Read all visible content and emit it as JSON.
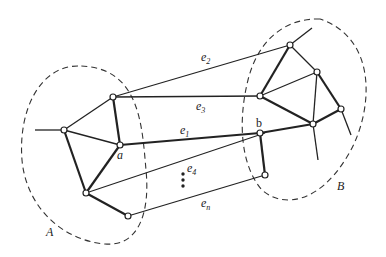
{
  "diagram": {
    "regions": [
      {
        "id": "A",
        "label": "A"
      },
      {
        "id": "B",
        "label": "B"
      }
    ],
    "nodes": {
      "a": {
        "label": "a"
      },
      "b": {
        "label": "b"
      }
    },
    "cut_edges": [
      {
        "id": "e1",
        "label": "e",
        "sub": "1",
        "from": "a",
        "to": "b"
      },
      {
        "id": "e2",
        "label": "e",
        "sub": "2",
        "from": "B",
        "to": "A"
      },
      {
        "id": "e3",
        "label": "e",
        "sub": "3",
        "from": "B",
        "to": "A"
      },
      {
        "id": "e4",
        "label": "e",
        "sub": "4",
        "from": "A",
        "to": "B"
      },
      {
        "id": "en",
        "label": "e",
        "sub": "n",
        "from": "B",
        "to": "A"
      }
    ],
    "ellipsis": "⋮",
    "colors": {
      "ink": "#222222",
      "background": "#ffffff"
    }
  }
}
